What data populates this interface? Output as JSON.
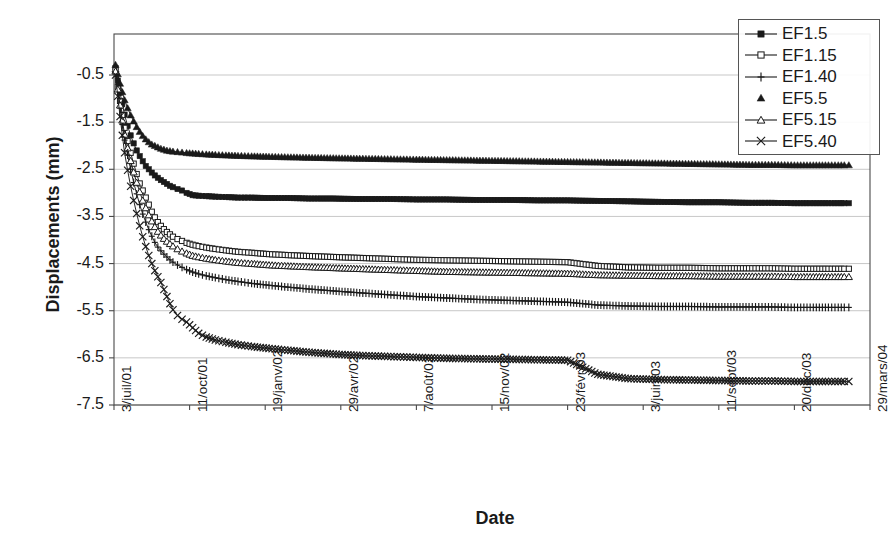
{
  "chart_data": {
    "type": "line",
    "title": "",
    "xlabel": "Date",
    "ylabel": "Displacements (mm)",
    "ylim": [
      -7.5,
      0.37
    ],
    "yticks": [
      "-0.5",
      "-1.5",
      "-2.5",
      "-3.5",
      "-4.5",
      "-5.5",
      "-6.5",
      "-7.5"
    ],
    "ytick_values": [
      -0.5,
      -1.5,
      -2.5,
      -3.5,
      -4.5,
      -5.5,
      -6.5,
      -7.5
    ],
    "xticks": [
      "3/juil/01",
      "11/oct/01",
      "19/janv/02",
      "29/avr/02",
      "7/août/02",
      "15/nov/02",
      "23/févr/03",
      "3/juin/03",
      "11/sept/03",
      "20/déc/03",
      "29/mars/04"
    ],
    "xtick_values": [
      0,
      100,
      200,
      300,
      400,
      500,
      600,
      700,
      800,
      900,
      1000
    ],
    "xlim": [
      0,
      1000
    ],
    "grid": "horizontal",
    "legend_position": "top-right",
    "series": [
      {
        "name": "EF1.5",
        "marker": "filled-square",
        "x": [
          2,
          5,
          8,
          11,
          14,
          18,
          22,
          26,
          30,
          34,
          38,
          42,
          46,
          50,
          54,
          58,
          62,
          66,
          70,
          74,
          78,
          84,
          90,
          96,
          104,
          112,
          122,
          134,
          148,
          164,
          182,
          205,
          230,
          258,
          290,
          325,
          362,
          400,
          440,
          480,
          520,
          560,
          600,
          640,
          680,
          720,
          760,
          800,
          840,
          870,
          900,
          925,
          945,
          958,
          966,
          972
        ],
        "y": [
          -0.35,
          -0.62,
          -0.88,
          -1.12,
          -1.34,
          -1.58,
          -1.78,
          -1.95,
          -2.1,
          -2.22,
          -2.33,
          -2.43,
          -2.5,
          -2.57,
          -2.63,
          -2.68,
          -2.73,
          -2.77,
          -2.81,
          -2.85,
          -2.88,
          -2.92,
          -2.95,
          -3.0,
          -3.05,
          -3.06,
          -3.07,
          -3.08,
          -3.09,
          -3.1,
          -3.1,
          -3.11,
          -3.11,
          -3.12,
          -3.12,
          -3.13,
          -3.13,
          -3.14,
          -3.14,
          -3.15,
          -3.15,
          -3.16,
          -3.16,
          -3.17,
          -3.18,
          -3.19,
          -3.2,
          -3.2,
          -3.21,
          -3.21,
          -3.22,
          -3.22,
          -3.22,
          -3.22,
          -3.22,
          -3.22
        ]
      },
      {
        "name": "EF1.15",
        "marker": "open-square",
        "x": [
          2,
          5,
          8,
          11,
          14,
          18,
          22,
          26,
          30,
          34,
          38,
          42,
          46,
          50,
          54,
          58,
          62,
          66,
          70,
          74,
          78,
          84,
          90,
          96,
          104,
          112,
          122,
          134,
          148,
          164,
          182,
          205,
          230,
          258,
          290,
          325,
          362,
          400,
          440,
          480,
          520,
          560,
          600,
          640,
          680,
          720,
          760,
          800,
          840,
          870,
          900,
          925,
          945,
          958,
          966,
          972
        ],
        "y": [
          -0.4,
          -0.75,
          -1.05,
          -1.35,
          -1.62,
          -1.9,
          -2.15,
          -2.38,
          -2.6,
          -2.8,
          -2.95,
          -3.1,
          -3.25,
          -3.4,
          -3.52,
          -3.62,
          -3.7,
          -3.77,
          -3.83,
          -3.88,
          -3.93,
          -3.98,
          -4.02,
          -4.06,
          -4.1,
          -4.13,
          -4.16,
          -4.19,
          -4.22,
          -4.25,
          -4.27,
          -4.3,
          -4.32,
          -4.34,
          -4.36,
          -4.38,
          -4.4,
          -4.42,
          -4.43,
          -4.44,
          -4.45,
          -4.46,
          -4.47,
          -4.55,
          -4.58,
          -4.59,
          -4.59,
          -4.6,
          -4.6,
          -4.6,
          -4.61,
          -4.61,
          -4.61,
          -4.61,
          -4.61,
          -4.61
        ]
      },
      {
        "name": "EF1.40",
        "marker": "plus",
        "x": [
          2,
          5,
          8,
          11,
          14,
          18,
          22,
          26,
          30,
          34,
          38,
          42,
          46,
          50,
          54,
          58,
          62,
          66,
          70,
          74,
          78,
          84,
          90,
          96,
          104,
          112,
          122,
          134,
          148,
          164,
          182,
          205,
          230,
          258,
          290,
          325,
          362,
          400,
          440,
          480,
          520,
          560,
          600,
          640,
          680,
          720,
          760,
          800,
          840,
          870,
          900,
          925,
          945,
          958,
          966,
          972
        ],
        "y": [
          -0.45,
          -0.85,
          -1.2,
          -1.55,
          -1.88,
          -2.2,
          -2.5,
          -2.78,
          -3.02,
          -3.25,
          -3.45,
          -3.62,
          -3.78,
          -3.92,
          -4.05,
          -4.15,
          -4.23,
          -4.3,
          -4.36,
          -4.42,
          -4.47,
          -4.53,
          -4.58,
          -4.63,
          -4.68,
          -4.72,
          -4.76,
          -4.8,
          -4.84,
          -4.88,
          -4.92,
          -4.96,
          -5.0,
          -5.04,
          -5.08,
          -5.12,
          -5.16,
          -5.2,
          -5.23,
          -5.26,
          -5.28,
          -5.3,
          -5.32,
          -5.38,
          -5.4,
          -5.41,
          -5.41,
          -5.42,
          -5.42,
          -5.42,
          -5.43,
          -5.43,
          -5.43,
          -5.43,
          -5.43,
          -5.43
        ]
      },
      {
        "name": "EF5.5",
        "marker": "filled-triangle",
        "x": [
          2,
          5,
          8,
          11,
          14,
          18,
          22,
          26,
          30,
          34,
          38,
          42,
          46,
          50,
          54,
          58,
          62,
          66,
          70,
          74,
          78,
          84,
          90,
          96,
          104,
          112,
          122,
          134,
          148,
          164,
          182,
          205,
          230,
          258,
          290,
          325,
          362,
          400,
          440,
          480,
          520,
          560,
          600,
          640,
          680,
          720,
          760,
          800,
          840,
          870,
          900,
          925,
          945,
          958,
          966,
          972
        ],
        "y": [
          -0.28,
          -0.48,
          -0.68,
          -0.86,
          -1.03,
          -1.2,
          -1.35,
          -1.48,
          -1.6,
          -1.7,
          -1.79,
          -1.86,
          -1.92,
          -1.97,
          -2.0,
          -2.03,
          -2.06,
          -2.08,
          -2.1,
          -2.11,
          -2.12,
          -2.13,
          -2.14,
          -2.15,
          -2.16,
          -2.17,
          -2.18,
          -2.19,
          -2.2,
          -2.21,
          -2.22,
          -2.23,
          -2.24,
          -2.25,
          -2.26,
          -2.27,
          -2.28,
          -2.29,
          -2.3,
          -2.31,
          -2.32,
          -2.33,
          -2.34,
          -2.35,
          -2.36,
          -2.37,
          -2.38,
          -2.39,
          -2.4,
          -2.4,
          -2.41,
          -2.41,
          -2.41,
          -2.41,
          -2.41,
          -2.41
        ]
      },
      {
        "name": "EF5.15",
        "marker": "open-triangle",
        "x": [
          2,
          5,
          8,
          11,
          14,
          18,
          22,
          26,
          30,
          34,
          38,
          42,
          46,
          50,
          54,
          58,
          62,
          66,
          70,
          74,
          78,
          84,
          90,
          96,
          104,
          112,
          122,
          134,
          148,
          164,
          182,
          205,
          230,
          258,
          290,
          325,
          362,
          400,
          440,
          480,
          520,
          560,
          600,
          640,
          680,
          720,
          760,
          800,
          840,
          870,
          900,
          925,
          945,
          958,
          966,
          972
        ],
        "y": [
          -0.42,
          -0.8,
          -1.14,
          -1.46,
          -1.76,
          -2.05,
          -2.32,
          -2.56,
          -2.78,
          -2.98,
          -3.16,
          -3.32,
          -3.47,
          -3.6,
          -3.72,
          -3.82,
          -3.9,
          -3.97,
          -4.03,
          -4.08,
          -4.13,
          -4.19,
          -4.24,
          -4.28,
          -4.33,
          -4.36,
          -4.39,
          -4.42,
          -4.45,
          -4.48,
          -4.5,
          -4.53,
          -4.55,
          -4.57,
          -4.59,
          -4.61,
          -4.63,
          -4.65,
          -4.67,
          -4.68,
          -4.69,
          -4.7,
          -4.71,
          -4.74,
          -4.75,
          -4.76,
          -4.76,
          -4.77,
          -4.77,
          -4.77,
          -4.78,
          -4.78,
          -4.78,
          -4.78,
          -4.78,
          -4.78
        ]
      },
      {
        "name": "EF5.40",
        "marker": "cross",
        "x": [
          2,
          5,
          8,
          11,
          14,
          18,
          22,
          26,
          30,
          34,
          38,
          42,
          46,
          50,
          54,
          58,
          62,
          66,
          70,
          74,
          78,
          84,
          90,
          96,
          104,
          112,
          122,
          134,
          148,
          164,
          182,
          205,
          230,
          258,
          290,
          325,
          362,
          400,
          440,
          480,
          520,
          560,
          600,
          640,
          680,
          720,
          760,
          800,
          840,
          870,
          900,
          925,
          945,
          958,
          966,
          972
        ],
        "y": [
          -0.5,
          -0.95,
          -1.38,
          -1.78,
          -2.15,
          -2.52,
          -2.86,
          -3.16,
          -3.44,
          -3.7,
          -3.93,
          -4.14,
          -4.33,
          -4.5,
          -4.65,
          -4.78,
          -4.9,
          -5.05,
          -5.2,
          -5.35,
          -5.48,
          -5.6,
          -5.68,
          -5.74,
          -5.86,
          -5.98,
          -6.06,
          -6.12,
          -6.17,
          -6.22,
          -6.26,
          -6.3,
          -6.34,
          -6.38,
          -6.42,
          -6.45,
          -6.47,
          -6.49,
          -6.51,
          -6.52,
          -6.53,
          -6.54,
          -6.55,
          -6.85,
          -6.94,
          -6.96,
          -6.97,
          -6.98,
          -6.99,
          -6.99,
          -7.0,
          -7.0,
          -7.0,
          -7.0,
          -7.0,
          -7.0
        ]
      }
    ]
  },
  "axes": {
    "ylabel": "Displacements (mm)",
    "xlabel": "Date"
  },
  "legend": {
    "items": [
      {
        "label": "EF1.5",
        "marker": "filled-square"
      },
      {
        "label": "EF1.15",
        "marker": "open-square"
      },
      {
        "label": "EF1.40",
        "marker": "plus"
      },
      {
        "label": "EF5.5",
        "marker": "filled-triangle"
      },
      {
        "label": "EF5.15",
        "marker": "open-triangle"
      },
      {
        "label": "EF5.40",
        "marker": "cross"
      }
    ]
  },
  "style": {
    "ink": "#1a1a1a",
    "grid": "#b9b9b9",
    "axis": "#4a4a4a"
  }
}
